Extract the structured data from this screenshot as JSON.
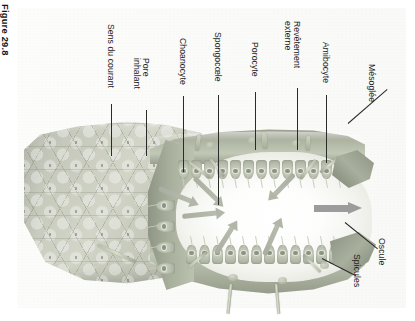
{
  "figure": {
    "number_label": "Figure 29.8",
    "language": "fr"
  },
  "labels": [
    {
      "id": "sens-du-courant",
      "text": "Sens du courant",
      "lines": [
        "Sens du courant"
      ]
    },
    {
      "id": "pore-inhalant",
      "text": "Pore inhalant",
      "lines": [
        "Pore",
        "inhalant"
      ]
    },
    {
      "id": "choanocyte",
      "text": "Choanocyte",
      "lines": [
        "Choanocyte"
      ]
    },
    {
      "id": "spongocoele",
      "text": "Spongocœle",
      "lines": [
        "Spongocœle"
      ]
    },
    {
      "id": "porocyte",
      "text": "Porocyte",
      "lines": [
        "Porocyte"
      ]
    },
    {
      "id": "revetement-externe",
      "text": "Revêtement externe",
      "lines": [
        "Revêtement",
        "externe"
      ]
    },
    {
      "id": "amibocyte",
      "text": "Amibocyte",
      "lines": [
        "Amibocyte"
      ]
    },
    {
      "id": "mesoglee",
      "text": "Mésoglée",
      "lines": [
        "Mésoglée"
      ]
    },
    {
      "id": "oscule",
      "text": "Oscule",
      "lines": [
        "Oscule"
      ]
    },
    {
      "id": "spicules",
      "text": "Spicules",
      "lines": [
        "Spicules"
      ]
    }
  ],
  "illustration": {
    "subject": "sponge-anatomy-cutaway",
    "orientation": "rotated-90-clockwise",
    "icons": {
      "flow_arrow": "arrow-right-icon",
      "exhalant_arrow": "big-arrow-right-icon"
    }
  },
  "colors": {
    "page_background": "#ffffff",
    "scan_panel": "#fbfbfa",
    "body_light": "#d2d5c8",
    "body_mid": "#b9bcb0",
    "body_dark": "#8f9584",
    "cavity": "#ffffff",
    "arrow_gray": "#9c9c9c",
    "leader_line": "#2b2b2b",
    "text": "#1c1c1c"
  }
}
